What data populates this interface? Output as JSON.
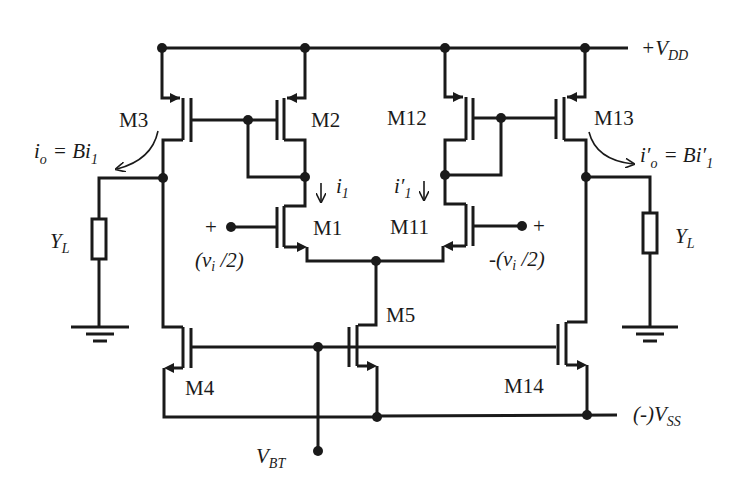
{
  "diagram": {
    "type": "circuit-schematic",
    "supplies": {
      "vdd": {
        "prefix": "+V",
        "sub": "DD"
      },
      "vss": {
        "prefix": "(-)V",
        "sub": "SS"
      },
      "vbt": {
        "prefix": "V",
        "sub": "BT"
      }
    },
    "transistors": [
      {
        "id": "M1",
        "label": "M1",
        "type": "nmos"
      },
      {
        "id": "M2",
        "label": "M2",
        "type": "pmos"
      },
      {
        "id": "M3",
        "label": "M3",
        "type": "pmos"
      },
      {
        "id": "M4",
        "label": "M4",
        "type": "nmos"
      },
      {
        "id": "M5",
        "label": "M5",
        "type": "nmos"
      },
      {
        "id": "M11",
        "label": "M11",
        "type": "nmos"
      },
      {
        "id": "M12",
        "label": "M12",
        "type": "pmos"
      },
      {
        "id": "M13",
        "label": "M13",
        "type": "pmos"
      },
      {
        "id": "M14",
        "label": "M14",
        "type": "nmos"
      }
    ],
    "currents": {
      "left_branch": {
        "sym": "i",
        "sub": "1"
      },
      "right_branch": {
        "sym": "i′",
        "sub": "1"
      },
      "left_output": {
        "lhs": "i",
        "lhs_sub": "o",
        "eq": "= Bi",
        "rhs_sub": "1"
      },
      "right_output": {
        "lhs": "i′",
        "lhs_sub": "o",
        "eq": "= Bi′",
        "rhs_sub": "1"
      }
    },
    "inputs": {
      "left": {
        "polarity": "+",
        "text": "(v",
        "sub": "i",
        "tail": " /2)"
      },
      "right": {
        "polarity": "+",
        "text": "-(v",
        "sub": "i",
        "tail": " /2)"
      }
    },
    "loads": [
      {
        "id": "YL-left",
        "sym": "Y",
        "sub": "L"
      },
      {
        "id": "YL-right",
        "sym": "Y",
        "sub": "L"
      }
    ]
  }
}
